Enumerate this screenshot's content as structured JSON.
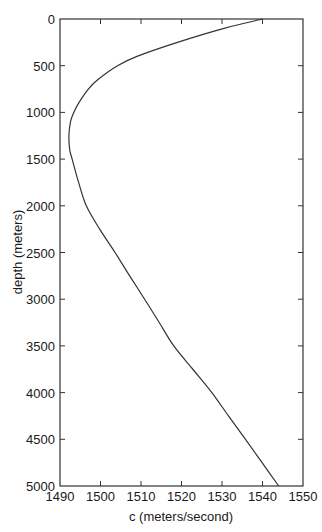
{
  "chart_data": {
    "type": "line",
    "title": "",
    "xlabel": "c (meters/second)",
    "ylabel": "depth (meters)",
    "xlim": [
      1490,
      1550
    ],
    "ylim": [
      0,
      5000
    ],
    "y_inverted": true,
    "grid": false,
    "legend": null,
    "x_ticks": [
      1490,
      1500,
      1510,
      1520,
      1530,
      1540,
      1550
    ],
    "y_ticks": [
      0,
      500,
      1000,
      1500,
      2000,
      2500,
      3000,
      3500,
      4000,
      4500,
      5000
    ],
    "series": [
      {
        "name": "sound speed profile",
        "color": "#333333",
        "depth": [
          0,
          100,
          250,
          400,
          500,
          650,
          750,
          900,
          1000,
          1100,
          1250,
          1400,
          1500,
          1750,
          2000,
          2250,
          2500,
          2750,
          3000,
          3250,
          3500,
          3750,
          4000,
          4250,
          4500,
          4750,
          5000
        ],
        "c": [
          1540.0,
          1530.5,
          1519.0,
          1509.0,
          1504.2,
          1499.3,
          1497.0,
          1494.6,
          1493.4,
          1492.6,
          1492.2,
          1492.4,
          1493.0,
          1494.6,
          1496.5,
          1499.8,
          1503.6,
          1507.2,
          1510.9,
          1514.5,
          1518.1,
          1522.8,
          1527.5,
          1531.6,
          1535.8,
          1539.9,
          1544.0
        ]
      }
    ]
  }
}
